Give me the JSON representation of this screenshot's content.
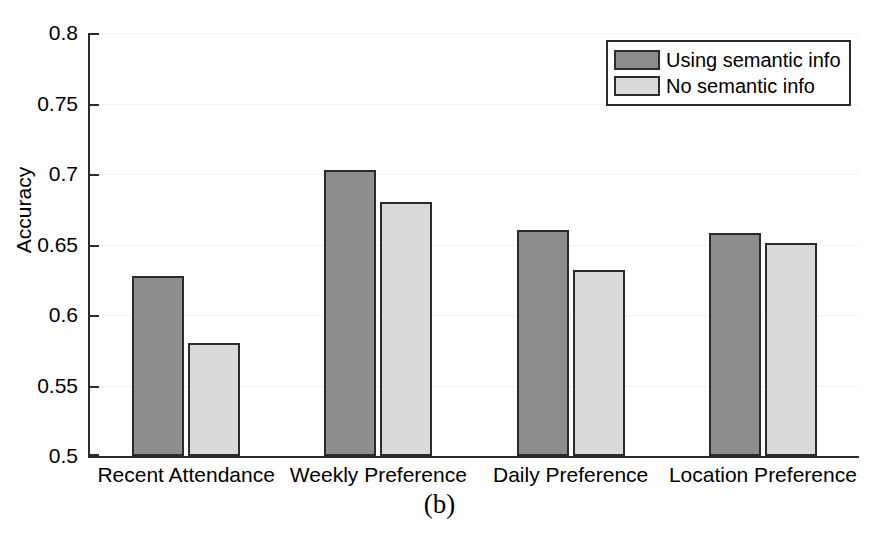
{
  "chart_data": {
    "type": "bar",
    "title": "",
    "caption": "(b)",
    "xlabel": "",
    "ylabel": "Accuracy",
    "categories": [
      "Recent Attendance",
      "Weekly Preference",
      "Daily Preference",
      "Location Preference"
    ],
    "series": [
      {
        "name": "Using semantic info",
        "color": "#8d8d8d",
        "values": [
          0.628,
          0.703,
          0.66,
          0.658
        ]
      },
      {
        "name": "No semantic info",
        "color": "#d9d9d9",
        "values": [
          0.58,
          0.68,
          0.632,
          0.651
        ]
      }
    ],
    "ylim": [
      0.5,
      0.8
    ],
    "yticks": [
      0.5,
      0.55,
      0.6,
      0.65,
      0.7,
      0.75,
      0.8
    ],
    "ytick_labels": [
      "0.5",
      "0.55",
      "0.6",
      "0.65",
      "0.7",
      "0.75",
      "0.8"
    ],
    "grid": true,
    "legend_position": "top-right",
    "axis_color": "#2b2b2b",
    "bar_edge_color": "#2b2b2b",
    "background": "#ffffff"
  }
}
